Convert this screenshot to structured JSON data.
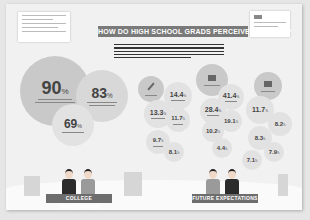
{
  "title": "HOW DO HIGH SCHOOL GRADS PERCEIVE COLLEGE?",
  "sections": {
    "left_label": "COLLEGE PERCEPTIONS",
    "right_label": "FUTURE EXPECTATIONS"
  },
  "perceptions": [
    {
      "value": "90",
      "unit": "%"
    },
    {
      "value": "83",
      "unit": "%"
    },
    {
      "value": "69",
      "unit": "%"
    }
  ],
  "expectations_group_1": [
    {
      "value": "14.4",
      "unit": "%"
    },
    {
      "value": "13.3",
      "unit": "%"
    },
    {
      "value": "11.7",
      "unit": "%"
    },
    {
      "value": "9.7",
      "unit": "%"
    },
    {
      "value": "8.1",
      "unit": "%"
    }
  ],
  "expectations_group_2": [
    {
      "value": "41.4",
      "unit": "%"
    },
    {
      "value": "28.4",
      "unit": "%"
    },
    {
      "value": "19.1",
      "unit": "%"
    },
    {
      "value": "10.2",
      "unit": "%"
    },
    {
      "value": "4.4",
      "unit": "%"
    }
  ],
  "expectations_group_3": [
    {
      "value": "11.7",
      "unit": "%"
    },
    {
      "value": "8.2",
      "unit": "%"
    },
    {
      "value": "8.3",
      "unit": "%"
    },
    {
      "value": "7.9",
      "unit": "%"
    },
    {
      "value": "7.1",
      "unit": "%"
    }
  ]
}
